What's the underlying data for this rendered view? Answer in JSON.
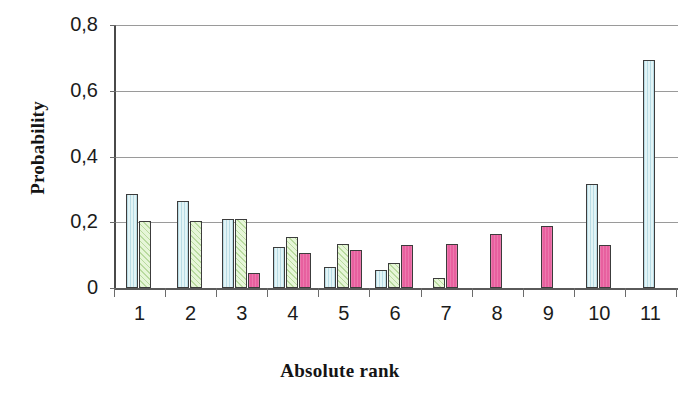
{
  "chart_data": {
    "type": "bar",
    "title": "",
    "xlabel": "Absolute rank",
    "ylabel": "Probability",
    "categories": [
      "1",
      "2",
      "3",
      "4",
      "5",
      "6",
      "7",
      "8",
      "9",
      "10",
      "11"
    ],
    "ylim": [
      0,
      0.8
    ],
    "ytick_labels": [
      "0,8",
      "0,6",
      "0,4",
      "0,2",
      "0"
    ],
    "ytick_values": [
      0.8,
      0.6,
      0.4,
      0.2,
      0
    ],
    "grid": "horizontal",
    "legend": "none",
    "decimal_separator": ",",
    "series": [
      {
        "name": "series-1",
        "color": "#e2f4f6",
        "values": [
          0.285,
          0.265,
          0.21,
          0.125,
          0.065,
          0.055,
          0,
          0,
          0,
          0.315,
          0.695
        ]
      },
      {
        "name": "series-2",
        "color": "#e6f6d8",
        "values": [
          0.205,
          0.205,
          0.21,
          0.155,
          0.135,
          0.075,
          0.03,
          0,
          0,
          0,
          0
        ]
      },
      {
        "name": "series-3",
        "color": "#e8609f",
        "values": [
          0,
          0,
          0.045,
          0.105,
          0.115,
          0.13,
          0.135,
          0.165,
          0.19,
          0.13,
          0
        ]
      }
    ]
  },
  "axes": {
    "y_title": "Probability",
    "x_title": "Absolute rank"
  }
}
